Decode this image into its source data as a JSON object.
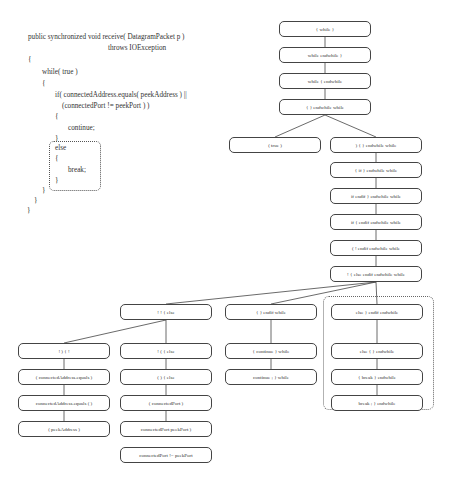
{
  "code": {
    "lines": [
      "public synchronized void receive( DatagramPacket p )",
      "throws IOException",
      "{",
      "while( true )",
      "{",
      "if( connectedAddress.equals( peekAddress ) ||",
      "(connectedPort != peekPort ) )",
      "{",
      "continue;",
      "}",
      "else",
      "{",
      "break;",
      "}",
      "}",
      "}",
      "}"
    ]
  },
  "tree": {
    "root_chain": [
      "{ while }",
      "while endwhile }",
      "while { endwhile",
      "{ } endwhile while"
    ],
    "true_node": "( true )",
    "right_chain": [
      ") { } endwhile while",
      "{ if } endwhile while",
      "if endif } endwhile while",
      "if { endif endwhile while",
      "( ! endif endwhile while",
      "! { else endif endwhile while"
    ],
    "branch_heads": [
      "! ! { else",
      "{ } endif while",
      "else } endif endwhile"
    ],
    "far_left_chain": [
      "! ) { !",
      "( connectedAddress.equals )",
      "connectedAddress.equals ( )",
      "( peekAddress )"
    ],
    "mid_left_chain": [
      "! ( { else",
      "( ) { else",
      "( connectedPort )",
      "connectedPort peekPort )",
      "connectedPort != peekPort"
    ],
    "mid_chain": [
      "{ continue } while",
      "continue ; } while"
    ],
    "else_chain": [
      "else { } endwhile",
      "{ break } endwhile",
      "break ; } endwhile"
    ]
  }
}
